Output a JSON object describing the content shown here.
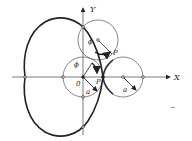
{
  "diagram": {
    "axes": {
      "x_label": "X",
      "y_label": "Y",
      "origin_label": "0"
    },
    "labels": {
      "phi_top": "ϕ",
      "phi_center": "ϕ",
      "p_top": "P",
      "p_center": "P",
      "a_center": "a",
      "a_right": "a"
    },
    "colors": {
      "stroke": "#222222",
      "thin_stroke": "#555555",
      "background": "#ffffff"
    },
    "geometry": {
      "origin": [
        83,
        77
      ],
      "radius_a": 20,
      "cusp": [
        103,
        77
      ],
      "cardioid_leftmost": [
        25,
        77
      ],
      "cardioid_bottom": [
        83,
        127
      ],
      "rolling_circle_top_center": [
        98,
        40
      ],
      "rolling_circle_right_center": [
        123,
        77
      ]
    }
  }
}
